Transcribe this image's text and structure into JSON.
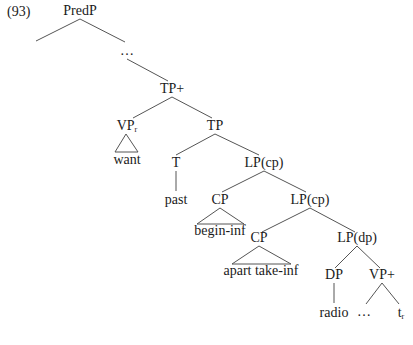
{
  "example_number": "(93)",
  "colors": {
    "line": "#555555",
    "text": "#1a1a1a",
    "background": "#ffffff"
  },
  "nodes": {
    "predp": "PredP",
    "ellipsis_top": "…",
    "tp_plus": "TP+",
    "vp_r": {
      "base": "VP",
      "sub": "r"
    },
    "want": "want",
    "tp": "TP",
    "t": "T",
    "past": "past",
    "lp_cp_1": "LP(cp)",
    "cp_1": "CP",
    "begin_inf": "begin-inf",
    "lp_cp_2": "LP(cp)",
    "cp_2": "CP",
    "apart_take_inf": "apart take-inf",
    "lp_dp": "LP(dp)",
    "dp": "DP",
    "radio": "radio",
    "vp_plus": "VP+",
    "ellipsis_bottom": "…",
    "trace": {
      "base": "t",
      "sub": "r"
    }
  }
}
